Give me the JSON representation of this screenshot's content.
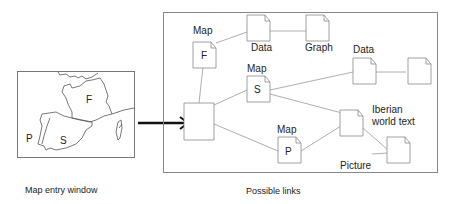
{
  "map_window": {
    "caption": "Map entry window",
    "regions": [
      {
        "letter": "F",
        "name": "France"
      },
      {
        "letter": "P",
        "name": "Portugal"
      },
      {
        "letter": "S",
        "name": "Spain"
      }
    ]
  },
  "links_panel": {
    "caption": "Possible links",
    "nodes": [
      {
        "id": "root",
        "label": "",
        "letter": ""
      },
      {
        "id": "map_f",
        "label": "Map",
        "letter": "F"
      },
      {
        "id": "data1",
        "label": "Data",
        "letter": ""
      },
      {
        "id": "graph",
        "label": "Graph",
        "letter": ""
      },
      {
        "id": "map_s",
        "label": "Map",
        "letter": "S"
      },
      {
        "id": "data2",
        "label": "Data",
        "letter": ""
      },
      {
        "id": "data2b",
        "label": "",
        "letter": ""
      },
      {
        "id": "map_p",
        "label": "Map",
        "letter": "P"
      },
      {
        "id": "iberian",
        "label": "Iberian world text",
        "letter": ""
      },
      {
        "id": "picture",
        "label": "Picture",
        "letter": ""
      }
    ],
    "edges": [
      [
        "root",
        "map_f"
      ],
      [
        "map_f",
        "data1"
      ],
      [
        "data1",
        "graph"
      ],
      [
        "root",
        "map_s"
      ],
      [
        "map_s",
        "data2"
      ],
      [
        "data2",
        "data2b"
      ],
      [
        "map_s",
        "iberian"
      ],
      [
        "root",
        "map_p"
      ],
      [
        "map_p",
        "iberian"
      ],
      [
        "iberian",
        "picture"
      ]
    ]
  },
  "labels": {
    "map_f": "Map",
    "letter_f": "F",
    "data1": "Data",
    "graph": "Graph",
    "map_s": "Map",
    "letter_s": "S",
    "data2": "Data",
    "map_p": "Map",
    "letter_p": "P",
    "iberian_1": "Iberian",
    "iberian_2": "world text",
    "picture": "Picture"
  }
}
